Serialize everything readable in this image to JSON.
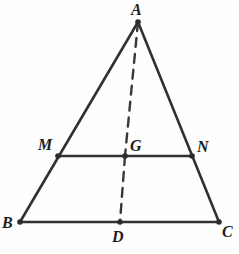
{
  "figure": {
    "background_color": "#fefefe",
    "stroke_color": "#33312f",
    "dash_color": "#3a3836",
    "vertex_dot_color": "#2e2c2a",
    "label_color": "#1d1d1d",
    "width": 239,
    "height": 254
  },
  "points": {
    "A": {
      "label": "A",
      "x": 138,
      "y": 22,
      "label_x": 131,
      "label_y": 2,
      "dot": true
    },
    "B": {
      "label": "B",
      "x": 20,
      "y": 222,
      "label_x": 2,
      "label_y": 215,
      "dot": true
    },
    "C": {
      "label": "C",
      "x": 219,
      "y": 222,
      "label_x": 222,
      "label_y": 224,
      "dot": true
    },
    "D": {
      "label": "D",
      "x": 120,
      "y": 222,
      "label_x": 112,
      "label_y": 229,
      "dot": true
    },
    "M": {
      "label": "M",
      "x": 58,
      "y": 156,
      "label_x": 38,
      "label_y": 137,
      "dot": true
    },
    "N": {
      "label": "N",
      "x": 192,
      "y": 156,
      "label_x": 197,
      "label_y": 139,
      "dot": true
    },
    "G": {
      "label": "G",
      "x": 125,
      "y": 156,
      "label_x": 130,
      "label_y": 138,
      "dot": true
    }
  },
  "segments": [
    {
      "name": "side-AB",
      "from": "A",
      "to": "B",
      "style": "solid",
      "width": 2.6
    },
    {
      "name": "side-AC",
      "from": "A",
      "to": "C",
      "style": "solid",
      "width": 2.6
    },
    {
      "name": "base-BC",
      "from": "B",
      "to": "C",
      "style": "solid",
      "width": 2.6
    },
    {
      "name": "midsegment-MN",
      "from": "M",
      "to": "N",
      "style": "solid",
      "width": 2.6
    },
    {
      "name": "median-AG",
      "from": "A",
      "to": "G",
      "style": "dashed",
      "width": 2.4
    },
    {
      "name": "median-GD",
      "from": "G",
      "to": "D",
      "style": "dashed",
      "width": 2.4
    }
  ],
  "dash_pattern": "9 7",
  "vertex_dot_radius": 2.8
}
